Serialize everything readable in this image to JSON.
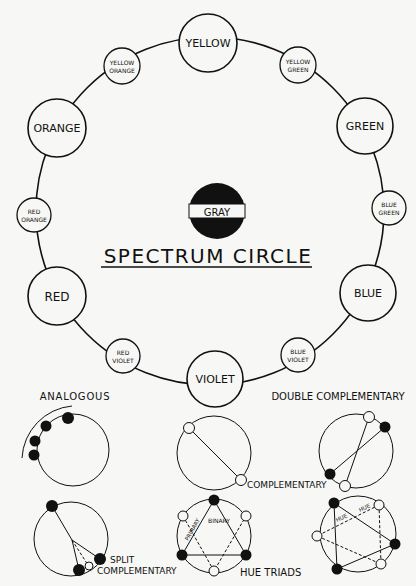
{
  "title": "SPECTRUM CIRCLE",
  "center": {
    "label": "GRAY"
  },
  "hues": [
    {
      "id": "yellow",
      "line1": "YELLOW",
      "line2": "",
      "cx": 208,
      "cy": 43,
      "r": 29,
      "size": 11
    },
    {
      "id": "yellow-green",
      "line1": "YELLOW",
      "line2": "GREEN",
      "cx": 298,
      "cy": 65,
      "r": 18,
      "size": 6
    },
    {
      "id": "green",
      "line1": "GREEN",
      "line2": "",
      "cx": 365,
      "cy": 126,
      "r": 28,
      "size": 11
    },
    {
      "id": "blue-green",
      "line1": "BLUE",
      "line2": "GREEN",
      "cx": 389,
      "cy": 208,
      "r": 17,
      "size": 6
    },
    {
      "id": "blue",
      "line1": "BLUE",
      "line2": "",
      "cx": 368,
      "cy": 293,
      "r": 28,
      "size": 11
    },
    {
      "id": "blue-violet",
      "line1": "BLUE",
      "line2": "VIOLET",
      "cx": 298,
      "cy": 355,
      "r": 17,
      "size": 6
    },
    {
      "id": "violet",
      "line1": "VIOLET",
      "line2": "",
      "cx": 215,
      "cy": 379,
      "r": 28,
      "size": 11
    },
    {
      "id": "red-violet",
      "line1": "RED",
      "line2": "VIOLET",
      "cx": 123,
      "cy": 356,
      "r": 17,
      "size": 6
    },
    {
      "id": "red",
      "line1": "RED",
      "line2": "",
      "cx": 57,
      "cy": 296,
      "r": 29,
      "size": 12
    },
    {
      "id": "red-orange",
      "line1": "RED",
      "line2": "ORANGE",
      "cx": 34,
      "cy": 215,
      "r": 17,
      "size": 6
    },
    {
      "id": "orange",
      "line1": "ORANGE",
      "line2": "",
      "cx": 57,
      "cy": 128,
      "r": 29,
      "size": 11
    },
    {
      "id": "yellow-orange",
      "line1": "YELLOW",
      "line2": "ORANGE",
      "cx": 122,
      "cy": 66,
      "r": 18,
      "size": 6
    }
  ],
  "harmonies": {
    "analogous": "ANALOGOUS",
    "complementary": "COMPLEMENTARY",
    "double_complementary": "DOUBLE COMPLEMENTARY",
    "split_line1": "SPLIT",
    "split_line2": "COMPLEMENTARY",
    "hue_triads": "HUE TRIADS",
    "primary": "PRIMARY",
    "binary": "BINARY",
    "hue_a": "HUE",
    "hue_b": "HUE"
  },
  "colors": {
    "ink": "#111111",
    "paper": "#f7f7f5"
  }
}
